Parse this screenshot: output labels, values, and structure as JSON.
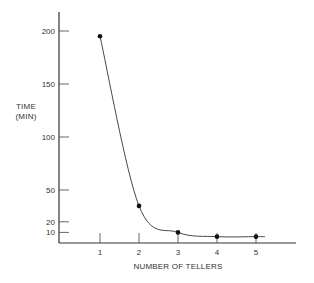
{
  "chart_data": {
    "type": "line",
    "title": "",
    "xlabel": "NUMBER OF TELLERS",
    "ylabel_lines": [
      "TIME",
      "(MIN)"
    ],
    "ylabel": "TIME (MIN)",
    "x": [
      1,
      2,
      3,
      4,
      5
    ],
    "values": [
      195,
      35,
      10,
      6,
      6
    ],
    "series": [
      {
        "name": "Waiting time",
        "x": [
          1,
          2,
          3,
          4,
          5
        ],
        "values": [
          195,
          35,
          10,
          6,
          6
        ]
      }
    ],
    "x_ticks": [
      "1",
      "2",
      "3",
      "4",
      "5"
    ],
    "y_ticks": [
      "200",
      "150",
      "100",
      "50",
      "20",
      "10"
    ],
    "xlim": [
      0,
      6
    ],
    "ylim": [
      0,
      220
    ],
    "grid": false,
    "legend": "none",
    "smooth_curve": true
  }
}
